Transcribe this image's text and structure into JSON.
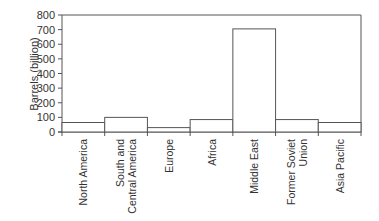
{
  "chart_data": {
    "type": "bar",
    "title": "",
    "xlabel": "",
    "ylabel": "Barrels (billion)",
    "ylim": [
      0,
      800
    ],
    "yticks": [
      0,
      100,
      200,
      300,
      400,
      500,
      600,
      700,
      800
    ],
    "grid": false,
    "legend": null,
    "categories": [
      "North America",
      "South and Central America",
      "Europe",
      "Africa",
      "Middle East",
      "Former Soviet Union",
      "Asia Pacific"
    ],
    "category_lines": [
      [
        "North America"
      ],
      [
        "South and",
        "Central America"
      ],
      [
        "Europe"
      ],
      [
        "Africa"
      ],
      [
        "Middle East"
      ],
      [
        "Former Soviet",
        "Union"
      ],
      [
        "Asia Pacific"
      ]
    ],
    "values": [
      65,
      100,
      30,
      85,
      705,
      85,
      65
    ]
  },
  "colors": {
    "axis": "#555555",
    "bar_edge": "#555555",
    "bar_fill": "#ffffff"
  }
}
